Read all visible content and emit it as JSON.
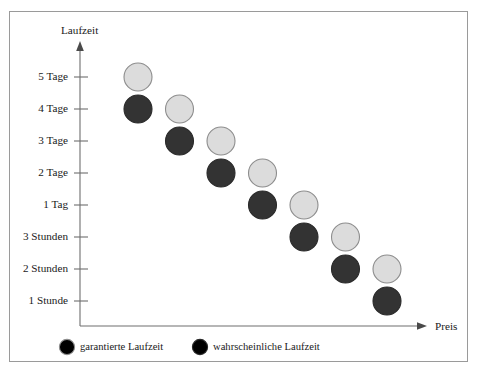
{
  "chart_data": {
    "type": "scatter",
    "title": "",
    "xlabel": "Preis",
    "ylabel": "Laufzeit",
    "grid": false,
    "legend_position": "bottom",
    "x_axis": {
      "label": "Preis",
      "has_arrow": true,
      "tick_labels": [],
      "note": "unlabeled continuous price axis, increasing to the right"
    },
    "y_axis": {
      "label": "Laufzeit",
      "has_arrow": true,
      "categories": [
        "5 Tage",
        "4 Tage",
        "3 Tage",
        "2 Tage",
        "1 Tag",
        "3 Stunden",
        "2 Stunden",
        "1 Stunde"
      ]
    },
    "series": [
      {
        "name": "garantierte Laufzeit",
        "color": "#dcdcdc",
        "edge_color": "#8d8d8d",
        "marker": "circle",
        "points": [
          {
            "x": 0,
            "y": "5 Tage"
          },
          {
            "x": 1,
            "y": "4 Tage"
          },
          {
            "x": 2,
            "y": "3 Tage"
          },
          {
            "x": 3,
            "y": "2 Tage"
          },
          {
            "x": 4,
            "y": "1 Tag"
          },
          {
            "x": 5,
            "y": "3 Stunden"
          },
          {
            "x": 6,
            "y": "2 Stunden"
          }
        ]
      },
      {
        "name": "wahrscheinliche Laufzeit",
        "color": "#333333",
        "edge_color": "#2a2a2a",
        "marker": "circle",
        "points": [
          {
            "x": 0,
            "y": "4 Tage"
          },
          {
            "x": 1,
            "y": "3 Tage"
          },
          {
            "x": 2,
            "y": "2 Tage"
          },
          {
            "x": 3,
            "y": "1 Tag"
          },
          {
            "x": 4,
            "y": "3 Stunden"
          },
          {
            "x": 5,
            "y": "2 Stunden"
          },
          {
            "x": 6,
            "y": "1 Stunde"
          }
        ]
      }
    ],
    "legend": [
      {
        "label": "garantierte Laufzeit",
        "color": "#dcdcdc",
        "edge_color": "#8d8d8d"
      },
      {
        "label": "wahrscheinliche Laufzeit",
        "color": "#333333",
        "edge_color": "#2a2a2a"
      }
    ]
  },
  "colors": {
    "frame": "#9a9a9a",
    "axis": "#6e6e6e",
    "text": "#1a1a1a",
    "light_marker": "#dcdcdc",
    "dark_marker": "#333333",
    "background": "#ffffff"
  }
}
